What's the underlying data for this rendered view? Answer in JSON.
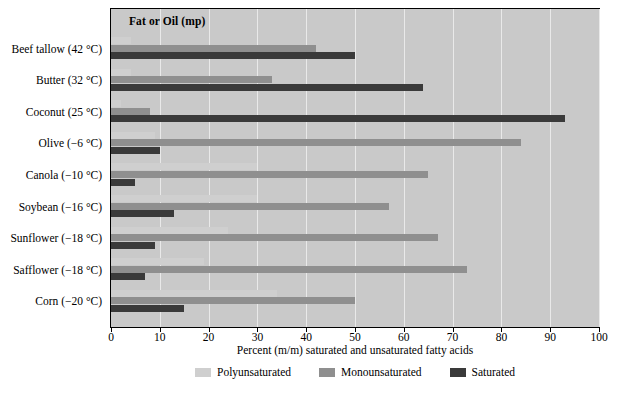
{
  "chart_data": {
    "type": "bar",
    "orientation": "horizontal",
    "title": "",
    "header_label": "Fat or Oil (mp)",
    "xlabel": "Percent (m/m) saturated and unsaturated fatty acids",
    "ylabel": "",
    "xlim": [
      0,
      100
    ],
    "xticks": [
      0,
      10,
      20,
      30,
      40,
      50,
      60,
      70,
      80,
      90,
      100
    ],
    "grid": true,
    "legend_position": "bottom",
    "categories": [
      "Beef tallow (42 °C)",
      "Butter (32 °C)",
      "Coconut (25 °C)",
      "Olive (−6 °C)",
      "Canola (−10 °C)",
      "Soybean (−16 °C)",
      "Sunflower (−18 °C)",
      "Safflower (−18 °C)",
      "Corn (−20 °C)"
    ],
    "series": [
      {
        "name": "Polyunsaturated",
        "color": "#cfcfcf",
        "values": [
          4,
          4,
          2,
          9,
          30,
          58,
          69,
          75,
          59
        ]
      },
      {
        "name": "Monounsaturated",
        "color": "#8f8f8f",
        "values": [
          42,
          30,
          6,
          84,
          62,
          23,
          20,
          13,
          24
        ]
      },
      {
        "name": "Saturated",
        "color": "#3a3a3a",
        "values": [
          50,
          65,
          92,
          14,
          7,
          15,
          11,
          9,
          13
        ]
      }
    ],
    "bars_drawn": [
      {
        "category": "Beef tallow (42 °C)",
        "polyunsaturated_end": 4,
        "monounsaturated_end": 42,
        "saturated_end": 50
      },
      {
        "category": "Butter (32 °C)",
        "polyunsaturated_end": 4,
        "monounsaturated_end": 33,
        "saturated_end": 64
      },
      {
        "category": "Coconut (25 °C)",
        "polyunsaturated_end": 2,
        "monounsaturated_end": 8,
        "saturated_end": 93
      },
      {
        "category": "Olive (−6 °C)",
        "polyunsaturated_end": 9,
        "monounsaturated_end": 84,
        "saturated_end": 10
      },
      {
        "category": "Canola (−10 °C)",
        "polyunsaturated_end": 30,
        "monounsaturated_end": 65,
        "saturated_end": 5
      },
      {
        "category": "Soybean (−16 °C)",
        "polyunsaturated_end": 30,
        "monounsaturated_end": 57,
        "saturated_end": 13
      },
      {
        "category": "Sunflower (−18 °C)",
        "polyunsaturated_end": 24,
        "monounsaturated_end": 67,
        "saturated_end": 9
      },
      {
        "category": "Safflower (−18 °C)",
        "polyunsaturated_end": 19,
        "monounsaturated_end": 73,
        "saturated_end": 7
      },
      {
        "category": "Corn (−20 °C)",
        "polyunsaturated_end": 34,
        "monounsaturated_end": 50,
        "saturated_end": 15
      }
    ],
    "legend": [
      {
        "label": "Polyunsaturated",
        "color": "#cfcfcf"
      },
      {
        "label": "Monounsaturated",
        "color": "#8f8f8f"
      },
      {
        "label": "Saturated",
        "color": "#3a3a3a"
      }
    ]
  }
}
